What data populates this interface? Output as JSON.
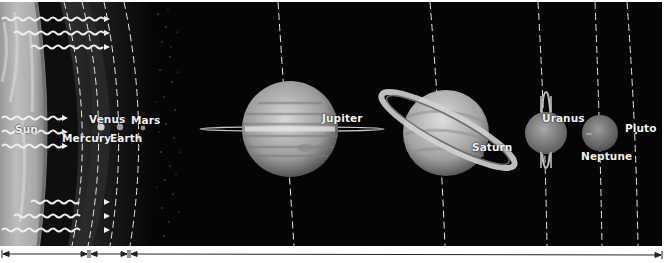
{
  "diagram": {
    "style": "grayscale",
    "colors": {
      "background": "#050505",
      "sun": "#c8c8c8",
      "orbit": "#e6e6e6",
      "label": "#f2f2f2",
      "page": "#ffffff"
    },
    "labels": {
      "sun": "Sun",
      "mercury": "Mercury",
      "venus": "Venus",
      "earth": "Earth",
      "mars": "Mars",
      "jupiter": "Jupiter",
      "saturn": "Saturn",
      "uranus": "Uranus",
      "neptune": "Neptune",
      "pluto": "Pluto"
    },
    "regions": [
      {
        "name": "sun-region",
        "x_start": 2,
        "x_end": 88
      },
      {
        "name": "inner-planets-region",
        "x_start": 90,
        "x_end": 128
      },
      {
        "name": "outer-planets-region",
        "x_start": 130,
        "x_end": 662
      }
    ]
  }
}
